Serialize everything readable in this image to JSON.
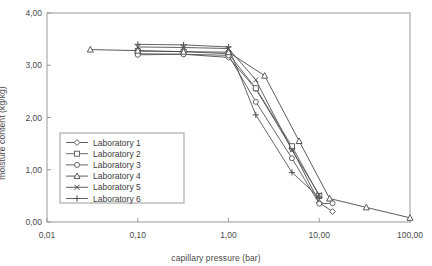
{
  "chart_data": {
    "type": "line",
    "title": "",
    "xlabel": "capillary pressure (bar)",
    "ylabel": "moisture content (kg/kg)",
    "xscale": "log",
    "yscale": "linear",
    "xlim": [
      0.01,
      100
    ],
    "ylim": [
      0,
      4
    ],
    "xticks": [
      0.01,
      0.1,
      1,
      10,
      100
    ],
    "xtick_labels": [
      "0,01",
      "0,10",
      "1,00",
      "10,00",
      "100,00"
    ],
    "yticks": [
      0,
      1,
      2,
      3,
      4
    ],
    "ytick_labels": [
      "0,00",
      "1,00",
      "2,00",
      "3,00",
      "4,00"
    ],
    "grid": false,
    "legend_position": "lower left",
    "decimal_separator": ",",
    "series": [
      {
        "name": "Laboratory 1",
        "marker": "diamond",
        "color": "#4d4d4d",
        "x": [
          0.1,
          0.32,
          1.0,
          2.0,
          5.0,
          10.0,
          14.0
        ],
        "y": [
          3.22,
          3.21,
          3.15,
          2.55,
          1.4,
          0.37,
          0.2
        ]
      },
      {
        "name": "Laboratory 2",
        "marker": "square",
        "color": "#5a5a5a",
        "x": [
          0.1,
          0.32,
          1.0,
          2.0,
          5.0,
          10.0
        ],
        "y": [
          3.27,
          3.26,
          3.22,
          2.56,
          1.45,
          0.5
        ]
      },
      {
        "name": "Laboratory 3",
        "marker": "circle",
        "color": "#555555",
        "x": [
          0.1,
          0.32,
          1.0,
          2.0,
          5.0,
          10.0,
          14.0
        ],
        "y": [
          3.2,
          3.21,
          3.19,
          2.3,
          1.22,
          0.35,
          0.36
        ]
      },
      {
        "name": "Laboratory 4",
        "marker": "triangle",
        "color": "#4a4a4a",
        "x": [
          0.03,
          0.1,
          0.32,
          1.0,
          2.5,
          6.0,
          13.0,
          33.0,
          100.0
        ],
        "y": [
          3.3,
          3.28,
          3.26,
          3.25,
          2.8,
          1.55,
          0.45,
          0.28,
          0.08
        ]
      },
      {
        "name": "Laboratory 5",
        "marker": "cross",
        "color": "#4f4f4f",
        "x": [
          0.1,
          0.32,
          1.0,
          2.0,
          5.0,
          10.0
        ],
        "y": [
          3.35,
          3.34,
          3.32,
          2.72,
          1.38,
          0.52
        ]
      },
      {
        "name": "Laboratory 6",
        "marker": "plus",
        "color": "#525252",
        "x": [
          0.1,
          0.32,
          1.0,
          2.0,
          5.0,
          10.0
        ],
        "y": [
          3.4,
          3.39,
          3.35,
          2.05,
          0.95,
          0.47
        ]
      }
    ]
  },
  "legend": {
    "entries": [
      {
        "label": "Laboratory 1"
      },
      {
        "label": "Laboratory 2"
      },
      {
        "label": "Laboratory 3"
      },
      {
        "label": "Laboratory 4"
      },
      {
        "label": "Laboratory 5"
      },
      {
        "label": "Laboratory 6"
      }
    ]
  }
}
